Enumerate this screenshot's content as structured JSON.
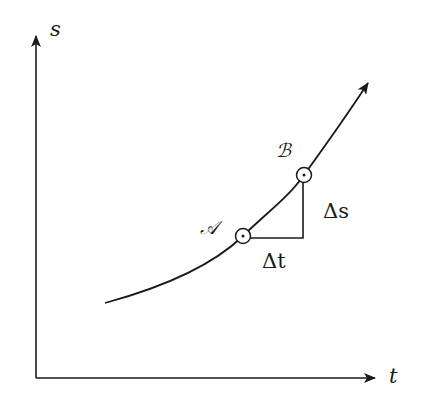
{
  "diagram": {
    "type": "position-time graph with secant triangle",
    "axes": {
      "y_label": "s",
      "x_label": "t"
    },
    "points": [
      {
        "name": "A",
        "label": "𝒜"
      },
      {
        "name": "B",
        "label": "ℬ"
      }
    ],
    "increments": {
      "delta_s": "Δs",
      "delta_t": "Δt"
    },
    "colors": {
      "stroke": "#1a1a1a",
      "background": "#ffffff"
    }
  }
}
